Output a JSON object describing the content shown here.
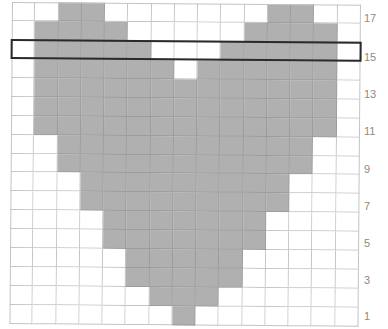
{
  "chart_data": {
    "type": "heatmap",
    "title": "",
    "columns": 15,
    "rows": 17,
    "row_numbering": "bottom-to-top",
    "row_labels": [
      "17",
      "15",
      "13",
      "11",
      "9",
      "7",
      "5",
      "3",
      "1"
    ],
    "highlighted_row": 15,
    "colors": {
      "filled": "#b0b0b0",
      "empty": "#ffffff",
      "gridline": "#c4c4c4",
      "highlight": "#2a2a2a",
      "label": "#8a8a8a"
    },
    "filled_columns_by_row": {
      "17": [
        2,
        3,
        11,
        12
      ],
      "16": [
        1,
        2,
        3,
        4,
        10,
        11,
        12,
        13
      ],
      "15": [
        1,
        2,
        3,
        4,
        5,
        9,
        10,
        11,
        12,
        13
      ],
      "14": [
        1,
        2,
        3,
        4,
        5,
        6,
        8,
        9,
        10,
        11,
        12,
        13
      ],
      "13": [
        1,
        2,
        3,
        4,
        5,
        6,
        7,
        8,
        9,
        10,
        11,
        12,
        13
      ],
      "12": [
        1,
        2,
        3,
        4,
        5,
        6,
        7,
        8,
        9,
        10,
        11,
        12,
        13
      ],
      "11": [
        1,
        2,
        3,
        4,
        5,
        6,
        7,
        8,
        9,
        10,
        11,
        12,
        13
      ],
      "10": [
        2,
        3,
        4,
        5,
        6,
        7,
        8,
        9,
        10,
        11,
        12
      ],
      "9": [
        2,
        3,
        4,
        5,
        6,
        7,
        8,
        9,
        10,
        11,
        12
      ],
      "8": [
        3,
        4,
        5,
        6,
        7,
        8,
        9,
        10,
        11
      ],
      "7": [
        3,
        4,
        5,
        6,
        7,
        8,
        9,
        10,
        11
      ],
      "6": [
        4,
        5,
        6,
        7,
        8,
        9,
        10
      ],
      "5": [
        4,
        5,
        6,
        7,
        8,
        9,
        10
      ],
      "4": [
        5,
        6,
        7,
        8,
        9
      ],
      "3": [
        5,
        6,
        7,
        8,
        9
      ],
      "2": [
        6,
        7,
        8
      ],
      "1": [
        7
      ]
    }
  },
  "labels": {
    "r17": "17",
    "r15": "15",
    "r13": "13",
    "r11": "11",
    "r9": "9",
    "r7": "7",
    "r5": "5",
    "r3": "3",
    "r1": "1"
  }
}
